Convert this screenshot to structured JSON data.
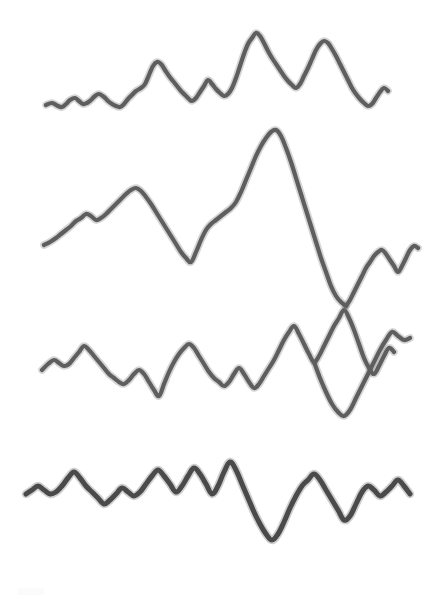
{
  "document": {
    "title": "Hand-drawn waveform traces",
    "description": "Four stacked hand-drawn irregular waveform / seismogram-like traces on plain white paper",
    "background_color": "#ffffff",
    "width": 422,
    "height": 611
  },
  "chart_data": {
    "type": "line",
    "title": "",
    "subtitle": "",
    "xlabel": "",
    "ylabel": "",
    "xlim": [
      0,
      422
    ],
    "ylim": [
      0,
      611
    ],
    "grid": false,
    "legend": "none",
    "axis_visible": false,
    "tick_labels_x": [],
    "tick_labels_y": [],
    "annotations": [],
    "note": "Y values are in screen pixel coordinates (0 = top of image). Each series is one free-hand drawn trace.",
    "series": [
      {
        "name": "trace-1",
        "label": "Waveform 1",
        "stroke_color": "#5e5e5e",
        "stroke_width": 4.2,
        "baseline_y": 103,
        "x": [
          46,
          52,
          58,
          62,
          66,
          70,
          75,
          79,
          83,
          87,
          91,
          95,
          99,
          104,
          108,
          112,
          116,
          120,
          124,
          128,
          132,
          136,
          141,
          145,
          149,
          153,
          157,
          161,
          165,
          169,
          173,
          177,
          181,
          185,
          189,
          192,
          196,
          200,
          204,
          208,
          212,
          216,
          220,
          224,
          228,
          232,
          236,
          240,
          244,
          248,
          252,
          256,
          260,
          264,
          268,
          272,
          276,
          280,
          284,
          288,
          292,
          296,
          300,
          304,
          308,
          312,
          316,
          320,
          324,
          328,
          332,
          336,
          340,
          344,
          348,
          352,
          356,
          360,
          364,
          368,
          372,
          376,
          380,
          384,
          388
        ],
        "y": [
          105,
          103,
          106,
          107,
          104,
          100,
          98,
          101,
          104,
          103,
          100,
          96,
          94,
          97,
          101,
          104,
          106,
          107,
          104,
          99,
          95,
          91,
          88,
          84,
          75,
          66,
          62,
          64,
          70,
          76,
          81,
          86,
          91,
          95,
          99,
          101,
          98,
          92,
          86,
          80,
          84,
          89,
          93,
          96,
          94,
          88,
          78,
          66,
          54,
          44,
          38,
          33,
          36,
          43,
          51,
          58,
          64,
          70,
          76,
          81,
          85,
          88,
          84,
          76,
          68,
          59,
          50,
          44,
          41,
          43,
          49,
          56,
          64,
          72,
          80,
          88,
          94,
          99,
          103,
          106,
          104,
          98,
          92,
          88,
          91
        ]
      },
      {
        "name": "trace-2",
        "label": "Waveform 2",
        "stroke_color": "#5e5e5e",
        "stroke_width": 4.2,
        "baseline_y": 230,
        "x": [
          44,
          50,
          56,
          61,
          66,
          71,
          76,
          81,
          86,
          91,
          96,
          101,
          106,
          111,
          116,
          121,
          126,
          131,
          136,
          141,
          146,
          151,
          156,
          161,
          166,
          171,
          176,
          181,
          186,
          191,
          196,
          201,
          206,
          211,
          216,
          221,
          226,
          231,
          236,
          241,
          246,
          251,
          256,
          261,
          266,
          271,
          276,
          281,
          286,
          291,
          296,
          301,
          306,
          311,
          316,
          321,
          326,
          331,
          336,
          341,
          346
        ],
        "y": [
          245,
          242,
          238,
          234,
          230,
          226,
          221,
          218,
          214,
          216,
          220,
          218,
          214,
          209,
          204,
          199,
          194,
          190,
          188,
          191,
          197,
          204,
          212,
          220,
          228,
          236,
          244,
          252,
          258,
          262,
          252,
          240,
          230,
          224,
          220,
          216,
          212,
          208,
          202,
          192,
          180,
          168,
          156,
          146,
          138,
          132,
          130,
          136,
          148,
          162,
          178,
          194,
          210,
          226,
          242,
          258,
          272,
          286,
          296,
          302,
          306
        ]
      },
      {
        "name": "trace-2b",
        "label": "Waveform 2 continuation",
        "stroke_color": "#5e5e5e",
        "stroke_width": 4.2,
        "baseline_y": 230,
        "x": [
          346,
          350,
          354,
          358,
          362,
          366,
          370,
          374,
          378,
          382,
          386,
          390,
          394,
          398,
          402,
          406,
          410,
          414,
          418
        ],
        "y": [
          306,
          300,
          292,
          284,
          276,
          268,
          262,
          256,
          252,
          250,
          254,
          260,
          266,
          272,
          266,
          258,
          250,
          246,
          248
        ]
      },
      {
        "name": "trace-3",
        "label": "Waveform 3",
        "stroke_color": "#5e5e5e",
        "stroke_width": 4.2,
        "baseline_y": 370,
        "x": [
          42,
          48,
          54,
          59,
          64,
          69,
          74,
          79,
          84,
          89,
          94,
          99,
          104,
          109,
          114,
          119,
          124,
          129,
          134,
          139,
          144,
          149,
          154,
          159,
          164,
          169,
          174,
          179,
          184,
          189,
          194,
          199,
          204,
          209,
          214,
          219,
          224,
          229,
          234,
          239,
          244,
          249,
          254,
          259,
          264,
          269,
          274,
          279,
          284,
          289,
          294,
          299,
          304,
          309,
          314,
          319,
          324,
          329,
          334,
          339,
          344,
          349,
          354,
          359,
          364,
          369,
          374,
          379,
          384,
          389,
          394
        ],
        "y": [
          370,
          364,
          360,
          363,
          366,
          364,
          358,
          352,
          346,
          350,
          356,
          362,
          368,
          374,
          378,
          382,
          384,
          380,
          374,
          370,
          374,
          382,
          390,
          396,
          384,
          372,
          362,
          354,
          348,
          344,
          348,
          356,
          364,
          372,
          378,
          382,
          386,
          382,
          374,
          368,
          374,
          382,
          388,
          384,
          376,
          368,
          360,
          350,
          340,
          332,
          326,
          334,
          344,
          354,
          362,
          356,
          346,
          336,
          326,
          318,
          310,
          318,
          330,
          344,
          358,
          368,
          374,
          366,
          356,
          348,
          352
        ]
      },
      {
        "name": "trace-3b",
        "label": "Waveform 3 right tail",
        "stroke_color": "#5e5e5e",
        "stroke_width": 4.2,
        "baseline_y": 370,
        "x": [
          314,
          320,
          326,
          332,
          338,
          344,
          350,
          356,
          362,
          368,
          374,
          380,
          386,
          392,
          398,
          404,
          410
        ],
        "y": [
          362,
          378,
          392,
          404,
          412,
          416,
          410,
          398,
          386,
          374,
          362,
          350,
          340,
          332,
          336,
          340,
          338
        ]
      },
      {
        "name": "trace-4",
        "label": "Waveform 4",
        "stroke_color": "#4a4a4a",
        "stroke_width": 5.0,
        "baseline_y": 500,
        "x": [
          26,
          32,
          38,
          44,
          50,
          56,
          62,
          68,
          74,
          80,
          86,
          92,
          98,
          104,
          110,
          116,
          122,
          128,
          134,
          140,
          146,
          152,
          158,
          164,
          170,
          176,
          182,
          188,
          194,
          200,
          206,
          212,
          218,
          224,
          230,
          236,
          242,
          248,
          254,
          260,
          266,
          272,
          278,
          284,
          290,
          296,
          302,
          308,
          314,
          320,
          326,
          332,
          338,
          344,
          350,
          356,
          362,
          368,
          374,
          380,
          386,
          392,
          398,
          404,
          410
        ],
        "y": [
          494,
          490,
          486,
          490,
          494,
          492,
          486,
          478,
          472,
          478,
          486,
          492,
          498,
          504,
          500,
          494,
          488,
          492,
          496,
          492,
          484,
          476,
          470,
          476,
          484,
          492,
          486,
          476,
          468,
          474,
          484,
          494,
          486,
          472,
          462,
          470,
          484,
          498,
          512,
          524,
          534,
          540,
          534,
          522,
          508,
          496,
          486,
          480,
          474,
          480,
          490,
          500,
          510,
          520,
          516,
          504,
          492,
          486,
          490,
          496,
          492,
          486,
          480,
          486,
          494
        ]
      }
    ]
  }
}
